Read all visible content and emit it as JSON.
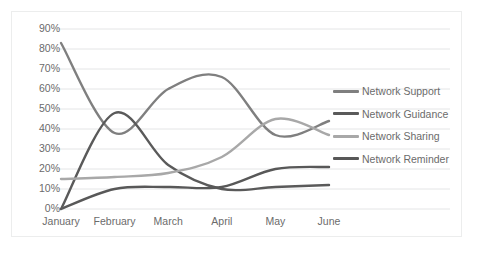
{
  "chart_data": {
    "type": "line",
    "title": "",
    "subtitle": "",
    "xlabel": "",
    "ylabel": "",
    "categories": [
      "January",
      "February",
      "March",
      "April",
      "May",
      "June"
    ],
    "ytick_labels": [
      "0%",
      "10%",
      "20%",
      "30%",
      "40%",
      "50%",
      "60%",
      "70%",
      "80%",
      "90%"
    ],
    "ytick_values": [
      0,
      10,
      20,
      30,
      40,
      50,
      60,
      70,
      80,
      90
    ],
    "ylim": [
      0,
      90
    ],
    "yunit": "%",
    "grid": true,
    "grid_axis": "y",
    "smooth": true,
    "legend_position": "right",
    "series": [
      {
        "name": "Network Support",
        "color": "#7f7f7f",
        "values": [
          83,
          38,
          60,
          66,
          37,
          44
        ]
      },
      {
        "name": "Network Guidance",
        "color": "#5a5a5a",
        "values": [
          0,
          48,
          22,
          10,
          11,
          12
        ]
      },
      {
        "name": "Network Sharing",
        "color": "#a8a8a8",
        "values": [
          15,
          16,
          18,
          26,
          45,
          37
        ]
      },
      {
        "name": "Network Reminder",
        "color": "#585858",
        "values": [
          0,
          10,
          11,
          11,
          20,
          21
        ]
      }
    ]
  },
  "colors": {
    "frame_border": "#eceded",
    "gridline": "#e4e5e6",
    "axis_text": "#6b6b6b",
    "background": "#ffffff"
  }
}
